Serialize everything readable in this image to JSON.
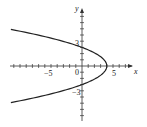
{
  "chart_data": {
    "type": "line",
    "title": "",
    "equation": "x = 4 - (4/9) y^2",
    "xlabel": "x",
    "ylabel": "y",
    "x_tick_labels": [
      {
        "value": -5,
        "label": "-5"
      },
      {
        "value": 0,
        "label": "0"
      },
      {
        "value": 5,
        "label": "5"
      }
    ],
    "y_tick_labels": [
      {
        "value": 3,
        "label": "3"
      },
      {
        "value": -3,
        "label": "-3"
      }
    ],
    "xlim": [
      -11.5,
      5.8
    ],
    "ylim": [
      -9,
      10
    ],
    "grid": false,
    "series": [
      {
        "name": "parabola",
        "points": [
          [
            -11.5,
            5.9
          ],
          [
            -8,
            5.2
          ],
          [
            -5,
            4.5
          ],
          [
            -2,
            3.67
          ],
          [
            0,
            3
          ],
          [
            2,
            2.12
          ],
          [
            3,
            1.5
          ],
          [
            3.6,
            0.95
          ],
          [
            4,
            0
          ],
          [
            3.6,
            -0.95
          ],
          [
            3,
            -1.5
          ],
          [
            2,
            -2.12
          ],
          [
            0,
            -3
          ],
          [
            -2,
            -3.67
          ],
          [
            -5,
            -4.5
          ],
          [
            -8,
            -5.2
          ],
          [
            -11.5,
            -5.9
          ]
        ]
      }
    ],
    "axis_color": "#333333",
    "curve_color": "#222222"
  },
  "labels": {
    "x_axis": "x",
    "y_axis": "y",
    "origin": "0",
    "x_neg5": "-5",
    "x_5": "5",
    "y_3": "3",
    "y_neg3": "-3"
  }
}
